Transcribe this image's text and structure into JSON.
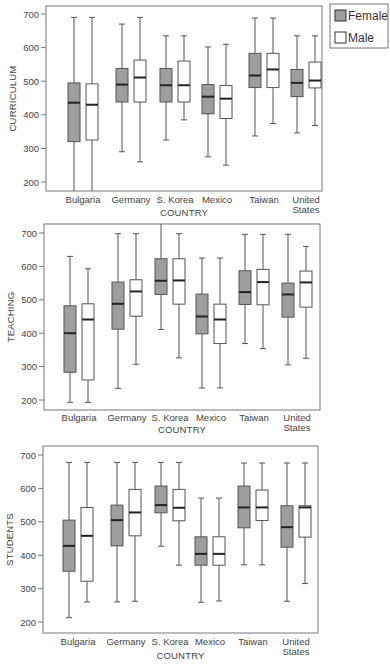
{
  "legend": {
    "items": [
      {
        "label": "Female",
        "fill": "#9e9e9e"
      },
      {
        "label": "Male",
        "fill": "#ffffff"
      }
    ]
  },
  "colors": {
    "female_fill": "#9e9e9e",
    "male_fill": "#ffffff",
    "stroke": "#555555",
    "median": "#222222",
    "frame": "#777777"
  },
  "chart_data": [
    {
      "type": "box",
      "title": "",
      "xlabel": "COUNTRY",
      "ylabel": "CURRICULUM",
      "ylim": [
        170,
        720
      ],
      "yticks": [
        200,
        300,
        400,
        500,
        600,
        700
      ],
      "categories": [
        "Bulgaria",
        "Germany",
        "S. Korea",
        "Mexico",
        "Taiwan",
        "United States"
      ],
      "series": [
        {
          "name": "Female",
          "boxes": [
            {
              "min": 170,
              "q1": 320,
              "median": 436,
              "q3": 495,
              "max": 690
            },
            {
              "min": 290,
              "q1": 438,
              "median": 490,
              "q3": 538,
              "max": 670
            },
            {
              "min": 325,
              "q1": 438,
              "median": 488,
              "q3": 538,
              "max": 635
            },
            {
              "min": 275,
              "q1": 403,
              "median": 454,
              "q3": 490,
              "max": 602
            },
            {
              "min": 337,
              "q1": 481,
              "median": 517,
              "q3": 583,
              "max": 688
            },
            {
              "min": 346,
              "q1": 454,
              "median": 495,
              "q3": 535,
              "max": 635
            }
          ]
        },
        {
          "name": "Male",
          "boxes": [
            {
              "min": 170,
              "q1": 325,
              "median": 430,
              "q3": 492,
              "max": 690
            },
            {
              "min": 260,
              "q1": 438,
              "median": 511,
              "q3": 563,
              "max": 690
            },
            {
              "min": 385,
              "q1": 438,
              "median": 488,
              "q3": 560,
              "max": 635
            },
            {
              "min": 250,
              "q1": 389,
              "median": 448,
              "q3": 487,
              "max": 610
            },
            {
              "min": 374,
              "q1": 481,
              "median": 535,
              "q3": 583,
              "max": 688
            },
            {
              "min": 368,
              "q1": 480,
              "median": 502,
              "q3": 557,
              "max": 635
            }
          ]
        }
      ]
    },
    {
      "type": "box",
      "title": "",
      "xlabel": "COUNTRY",
      "ylabel": "TEACHING",
      "ylim": [
        170,
        725
      ],
      "yticks": [
        200,
        300,
        400,
        500,
        600,
        700
      ],
      "categories": [
        "Bulgaria",
        "Germany",
        "S. Korea",
        "Mexico",
        "Taiwan",
        "United States"
      ],
      "series": [
        {
          "name": "Female",
          "boxes": [
            {
              "min": 193,
              "q1": 283,
              "median": 400,
              "q3": 482,
              "max": 630
            },
            {
              "min": 235,
              "q1": 412,
              "median": 488,
              "q3": 553,
              "max": 698
            },
            {
              "min": 411,
              "q1": 516,
              "median": 557,
              "q3": 623,
              "max": 730
            },
            {
              "min": 236,
              "q1": 398,
              "median": 450,
              "q3": 517,
              "max": 625
            },
            {
              "min": 369,
              "q1": 486,
              "median": 523,
              "q3": 587,
              "max": 696
            },
            {
              "min": 305,
              "q1": 448,
              "median": 516,
              "q3": 550,
              "max": 696
            }
          ]
        },
        {
          "name": "Male",
          "boxes": [
            {
              "min": 193,
              "q1": 260,
              "median": 441,
              "q3": 488,
              "max": 593
            },
            {
              "min": 307,
              "q1": 451,
              "median": 525,
              "q3": 560,
              "max": 698
            },
            {
              "min": 326,
              "q1": 487,
              "median": 558,
              "q3": 623,
              "max": 698
            },
            {
              "min": 236,
              "q1": 369,
              "median": 441,
              "q3": 487,
              "max": 625
            },
            {
              "min": 354,
              "q1": 485,
              "median": 553,
              "q3": 591,
              "max": 696
            },
            {
              "min": 325,
              "q1": 478,
              "median": 552,
              "q3": 586,
              "max": 660
            }
          ]
        }
      ]
    },
    {
      "type": "box",
      "title": "",
      "xlabel": "COUNTRY",
      "ylabel": "STUDENTS",
      "ylim": [
        170,
        725
      ],
      "yticks": [
        200,
        300,
        400,
        500,
        600,
        700
      ],
      "categories": [
        "Bulgaria",
        "Germany",
        "S. Korea",
        "Mexico",
        "Taiwan",
        "United States"
      ],
      "series": [
        {
          "name": "Female",
          "boxes": [
            {
              "min": 213,
              "q1": 352,
              "median": 428,
              "q3": 505,
              "max": 678
            },
            {
              "min": 260,
              "q1": 428,
              "median": 505,
              "q3": 550,
              "max": 678
            },
            {
              "min": 427,
              "q1": 527,
              "median": 550,
              "q3": 607,
              "max": 678
            },
            {
              "min": 259,
              "q1": 370,
              "median": 404,
              "q3": 455,
              "max": 571
            },
            {
              "min": 371,
              "q1": 482,
              "median": 543,
              "q3": 607,
              "max": 676
            },
            {
              "min": 262,
              "q1": 424,
              "median": 484,
              "q3": 548,
              "max": 676
            }
          ]
        },
        {
          "name": "Male",
          "boxes": [
            {
              "min": 260,
              "q1": 322,
              "median": 458,
              "q3": 543,
              "max": 678
            },
            {
              "min": 262,
              "q1": 458,
              "median": 528,
              "q3": 597,
              "max": 678
            },
            {
              "min": 370,
              "q1": 503,
              "median": 542,
              "q3": 597,
              "max": 678
            },
            {
              "min": 263,
              "q1": 370,
              "median": 404,
              "q3": 455,
              "max": 571
            },
            {
              "min": 371,
              "q1": 504,
              "median": 543,
              "q3": 595,
              "max": 676
            },
            {
              "min": 315,
              "q1": 454,
              "median": 543,
              "q3": 548,
              "max": 676
            }
          ]
        }
      ]
    }
  ]
}
